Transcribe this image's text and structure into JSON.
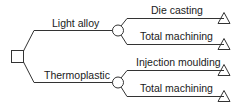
{
  "diagram": {
    "type": "decision-tree",
    "root": {
      "shape": "square",
      "label": ""
    },
    "branches": [
      {
        "label": "Light alloy",
        "chance_node": "circle",
        "outcomes": [
          {
            "label": "Die casting",
            "end": "triangle"
          },
          {
            "label": "Total machining",
            "end": "triangle"
          }
        ]
      },
      {
        "label": "Thermoplastic",
        "chance_node": "circle",
        "outcomes": [
          {
            "label": "Injection moulding",
            "end": "triangle"
          },
          {
            "label": "Total machining",
            "end": "triangle"
          }
        ]
      }
    ],
    "stroke_color": "#333333"
  }
}
